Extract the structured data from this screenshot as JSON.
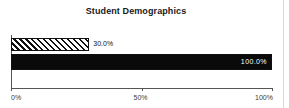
{
  "chart": {
    "title": "Student Demographics",
    "background_color": "#ffffff",
    "axis_color": "#555555",
    "border_color": "#d8d8d8"
  },
  "chart_data": {
    "type": "bar",
    "orientation": "horizontal",
    "title": "Student Demographics",
    "xlabel": "",
    "ylabel": "",
    "xlim": [
      0,
      100
    ],
    "grid": false,
    "legend": null,
    "categories": [
      "bar-1",
      "bar-2"
    ],
    "values": [
      30.0,
      100.0
    ],
    "data_labels": [
      "30.0%",
      "100.0%"
    ],
    "bar_styles": [
      "hatched-diagonal",
      "solid-black"
    ],
    "label_positions": [
      "outside",
      "inside"
    ],
    "label_colors": [
      "#111111",
      "#ffffff"
    ],
    "x_ticks": [
      0,
      50,
      100
    ],
    "x_tick_labels": [
      "0%",
      "50%",
      "100%"
    ]
  }
}
